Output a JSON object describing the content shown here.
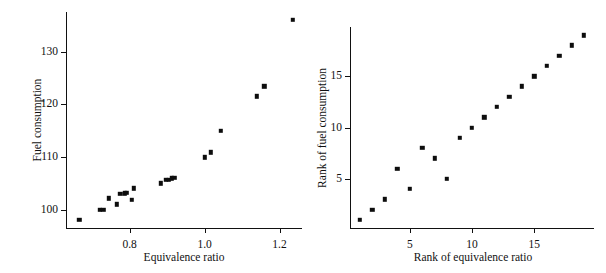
{
  "figure": {
    "background": "#ffffff",
    "marker_color": "#0d0d0d",
    "axis_color": "#111111"
  },
  "chart_data": [
    {
      "type": "scatter",
      "panel": "left",
      "title": "",
      "xlabel": "Equivalence ratio",
      "ylabel": "Fuel consumption",
      "xlim": [
        0.63,
        1.26
      ],
      "ylim": [
        96.5,
        137.5
      ],
      "xticks": [
        0.8,
        1.0,
        1.2
      ],
      "xticklabels": [
        "0.8",
        "1.0",
        "1.2"
      ],
      "yticks": [
        100,
        110,
        120,
        130
      ],
      "yticklabels": [
        "100",
        "110",
        "120",
        "130"
      ],
      "grid": false,
      "legend": "none",
      "x": [
        0.665,
        0.72,
        0.73,
        0.745,
        0.765,
        0.775,
        0.787,
        0.793,
        0.806,
        0.811,
        0.883,
        0.897,
        0.905,
        0.912,
        0.919,
        1.001,
        1.017,
        1.043,
        1.139,
        1.159,
        1.236
      ],
      "y": [
        98.0,
        99.9,
        100.0,
        102.1,
        101.0,
        103.0,
        103.1,
        103.2,
        101.9,
        104.0,
        105.0,
        105.6,
        105.7,
        105.9,
        106.0,
        109.9,
        110.9,
        115.0,
        121.5,
        123.4,
        136.0
      ],
      "points": [
        {
          "x": 0.665,
          "y": 98.0
        },
        {
          "x": 0.72,
          "y": 99.9
        },
        {
          "x": 0.73,
          "y": 100.0
        },
        {
          "x": 0.745,
          "y": 102.1
        },
        {
          "x": 0.765,
          "y": 101.0
        },
        {
          "x": 0.775,
          "y": 103.0
        },
        {
          "x": 0.787,
          "y": 103.1
        },
        {
          "x": 0.793,
          "y": 103.2
        },
        {
          "x": 0.806,
          "y": 101.9
        },
        {
          "x": 0.811,
          "y": 104.0
        },
        {
          "x": 0.883,
          "y": 105.0
        },
        {
          "x": 0.897,
          "y": 105.6
        },
        {
          "x": 0.905,
          "y": 105.7
        },
        {
          "x": 0.912,
          "y": 105.9
        },
        {
          "x": 0.919,
          "y": 106.0
        },
        {
          "x": 1.001,
          "y": 109.9
        },
        {
          "x": 1.017,
          "y": 110.9
        },
        {
          "x": 1.043,
          "y": 115.0
        },
        {
          "x": 1.139,
          "y": 121.5
        },
        {
          "x": 1.159,
          "y": 123.4
        },
        {
          "x": 1.236,
          "y": 136.0
        }
      ]
    },
    {
      "type": "scatter",
      "panel": "right",
      "title": "",
      "xlabel": "Rank of equivalence ratio",
      "ylabel": "Rank of fuel consumption",
      "xlim": [
        0.2,
        19.8
      ],
      "ylim": [
        0.2,
        19.8
      ],
      "xticks": [
        5,
        10,
        15
      ],
      "xticklabels": [
        "5",
        "10",
        "15"
      ],
      "yticks": [
        5,
        10,
        15
      ],
      "yticklabels": [
        "5",
        "10",
        "15"
      ],
      "grid": false,
      "legend": "none",
      "x": [
        1,
        2,
        3,
        4,
        5,
        6,
        7,
        8,
        9,
        10,
        11,
        12,
        13,
        14,
        15,
        16,
        17,
        18,
        19
      ],
      "y": [
        1,
        2,
        3,
        6,
        4,
        8,
        7,
        5,
        9,
        10,
        11,
        12,
        13,
        14,
        15,
        16,
        17,
        18,
        19
      ],
      "points": [
        {
          "x": 1,
          "y": 1
        },
        {
          "x": 2,
          "y": 2
        },
        {
          "x": 3,
          "y": 3
        },
        {
          "x": 4,
          "y": 6
        },
        {
          "x": 5,
          "y": 4
        },
        {
          "x": 6,
          "y": 8
        },
        {
          "x": 7,
          "y": 7
        },
        {
          "x": 8,
          "y": 5
        },
        {
          "x": 9,
          "y": 9
        },
        {
          "x": 10,
          "y": 10
        },
        {
          "x": 11,
          "y": 11
        },
        {
          "x": 12,
          "y": 12
        },
        {
          "x": 13,
          "y": 13
        },
        {
          "x": 14,
          "y": 14
        },
        {
          "x": 15,
          "y": 15
        },
        {
          "x": 16,
          "y": 16
        },
        {
          "x": 17,
          "y": 17
        },
        {
          "x": 18,
          "y": 18
        },
        {
          "x": 19,
          "y": 19
        }
      ]
    }
  ]
}
